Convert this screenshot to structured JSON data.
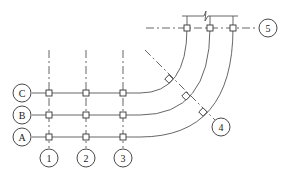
{
  "diagram": {
    "type": "structural-grid-plan",
    "row_axes": [
      {
        "label": "C",
        "y": 93
      },
      {
        "label": "B",
        "y": 115
      },
      {
        "label": "A",
        "y": 137
      }
    ],
    "column_axes": [
      {
        "label": "1",
        "x": 49
      },
      {
        "label": "2",
        "x": 86
      },
      {
        "label": "3",
        "x": 123
      }
    ],
    "radial_axis": {
      "label": "4"
    },
    "top_axis": {
      "label": "5"
    },
    "colors": {
      "line": "#555555",
      "text": "#222222",
      "background": "#ffffff"
    }
  }
}
